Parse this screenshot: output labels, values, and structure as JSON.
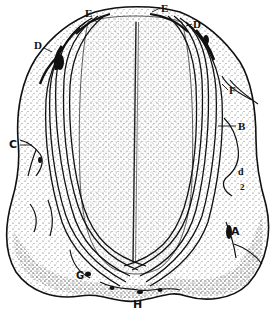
{
  "figure": {
    "type": "anatomical line illustration (section with fibre tracts)",
    "labels": [
      {
        "id": "E-left",
        "text": "E",
        "x": 85,
        "y": 8,
        "size": 11
      },
      {
        "id": "E-right",
        "text": "E",
        "x": 161,
        "y": 3,
        "size": 11
      },
      {
        "id": "D-left",
        "text": "D",
        "x": 34,
        "y": 40,
        "size": 11
      },
      {
        "id": "D-right",
        "text": "D",
        "x": 193,
        "y": 19,
        "size": 11
      },
      {
        "id": "F",
        "text": "F",
        "x": 229,
        "y": 85,
        "size": 11
      },
      {
        "id": "B",
        "text": "B",
        "x": 238,
        "y": 123,
        "size": 11
      },
      {
        "id": "C",
        "text": "C",
        "x": 9,
        "y": 141,
        "size": 11
      },
      {
        "id": "d",
        "text": "d",
        "x": 238,
        "y": 169,
        "size": 10
      },
      {
        "id": "2",
        "text": "2",
        "x": 240,
        "y": 185,
        "size": 9
      },
      {
        "id": "A",
        "text": "A",
        "x": 231,
        "y": 228,
        "size": 11
      },
      {
        "id": "G",
        "text": "G",
        "x": 76,
        "y": 273,
        "size": 10
      },
      {
        "id": "H",
        "text": "H",
        "x": 133,
        "y": 300,
        "size": 11
      }
    ],
    "colors": {
      "ink": "#111111",
      "paper": "#ffffff",
      "stipple": "#555555"
    }
  }
}
